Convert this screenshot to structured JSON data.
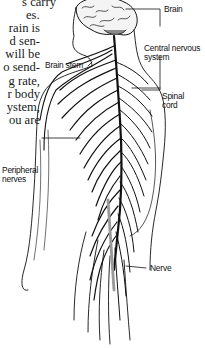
{
  "body_text": {
    "lines": [
      "s carry",
      "es.",
      "rain is",
      "d sen-",
      "will be",
      "o send-",
      "g rate,",
      "r body",
      "ystem,",
      "ou are"
    ]
  },
  "figure": {
    "labels": {
      "brain": "Brain",
      "brain_stem": "Brain stem",
      "cns_line1": "Central nervous",
      "cns_line2": "system",
      "spinal_line1": "Spinal",
      "spinal_line2": "cord",
      "peripheral_line1": "Peripheral",
      "peripheral_line2": "nerves",
      "nerve": "Nerve"
    },
    "colors": {
      "ink": "#111111",
      "text": "#1a1a1a",
      "background": "#ffffff",
      "brain_shade": "#8a8a8a"
    }
  }
}
